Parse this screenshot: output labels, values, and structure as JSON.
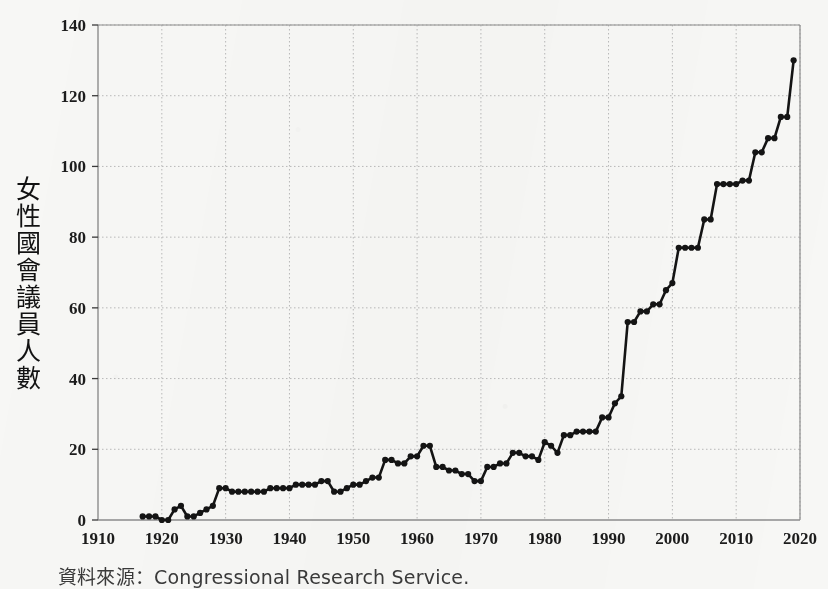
{
  "figure": {
    "y_axis_label": "女性國會議員人數",
    "y_axis_label_chars": [
      "女",
      "性",
      "國",
      "會",
      "議",
      "員",
      "人",
      "數"
    ],
    "source_note": "資料來源：Congressional Research Service.",
    "line_color": "#141414",
    "grid_color": "#b9b9b9",
    "border_color": "#8d8d8d",
    "background_color": "#f7f7f5"
  },
  "chart_data": {
    "type": "line",
    "title": "",
    "xlabel": "",
    "ylabel": "女性國會議員人數",
    "xlim": [
      1910,
      2020
    ],
    "ylim": [
      0,
      140
    ],
    "xticks": [
      1910,
      1920,
      1930,
      1940,
      1950,
      1960,
      1970,
      1980,
      1990,
      2000,
      2010,
      2020
    ],
    "yticks": [
      0,
      20,
      40,
      60,
      80,
      100,
      120,
      140
    ],
    "grid": true,
    "legend": false,
    "markers": true,
    "series": [
      {
        "name": "女性國會議員人數",
        "x": [
          1917,
          1918,
          1919,
          1920,
          1921,
          1922,
          1923,
          1924,
          1925,
          1926,
          1927,
          1928,
          1929,
          1930,
          1931,
          1932,
          1933,
          1934,
          1935,
          1936,
          1937,
          1938,
          1939,
          1940,
          1941,
          1942,
          1943,
          1944,
          1945,
          1946,
          1947,
          1948,
          1949,
          1950,
          1951,
          1952,
          1953,
          1954,
          1955,
          1956,
          1957,
          1958,
          1959,
          1960,
          1961,
          1962,
          1963,
          1964,
          1965,
          1966,
          1967,
          1968,
          1969,
          1970,
          1971,
          1972,
          1973,
          1974,
          1975,
          1976,
          1977,
          1978,
          1979,
          1980,
          1981,
          1982,
          1983,
          1984,
          1985,
          1986,
          1987,
          1988,
          1989,
          1990,
          1991,
          1992,
          1993,
          1994,
          1995,
          1996,
          1997,
          1998,
          1999,
          2000,
          2001,
          2002,
          2003,
          2004,
          2005,
          2006,
          2007,
          2008,
          2009,
          2010,
          2011,
          2012,
          2013,
          2014,
          2015,
          2016,
          2017,
          2018,
          2019
        ],
        "values": [
          1,
          1,
          1,
          0,
          0,
          3,
          4,
          1,
          1,
          2,
          3,
          4,
          9,
          9,
          8,
          8,
          8,
          8,
          8,
          8,
          9,
          9,
          9,
          9,
          10,
          10,
          10,
          10,
          11,
          11,
          8,
          8,
          9,
          10,
          10,
          11,
          12,
          12,
          17,
          17,
          16,
          16,
          18,
          18,
          21,
          21,
          15,
          15,
          14,
          14,
          13,
          13,
          11,
          11,
          15,
          15,
          16,
          16,
          19,
          19,
          18,
          18,
          17,
          22,
          21,
          19,
          24,
          24,
          25,
          25,
          25,
          25,
          29,
          29,
          33,
          35,
          56,
          56,
          59,
          59,
          61,
          61,
          65,
          67,
          77,
          77,
          77,
          77,
          85,
          85,
          95,
          95,
          95,
          95,
          96,
          96,
          104,
          104,
          108,
          108,
          114,
          114,
          130
        ]
      }
    ]
  }
}
